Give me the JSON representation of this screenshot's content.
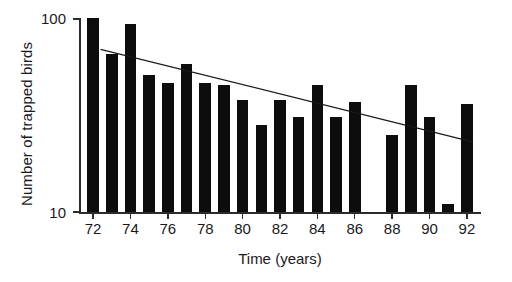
{
  "chart_data": {
    "type": "bar",
    "title": "",
    "subtitle": "",
    "xlabel": "Time (years)",
    "ylabel": "Number of trapped birds",
    "yscale": "log",
    "ylim": [
      10,
      100
    ],
    "ytick_labels": [
      "100",
      "10"
    ],
    "ytick_values": [
      100,
      10
    ],
    "xlim": [
      71.3,
      92.7
    ],
    "xtick_labels": [
      "72",
      "74",
      "76",
      "78",
      "80",
      "82",
      "84",
      "86",
      "88",
      "90",
      "92"
    ],
    "xtick_values": [
      72,
      74,
      76,
      78,
      80,
      82,
      84,
      86,
      88,
      90,
      92
    ],
    "grid": false,
    "legend": false,
    "categories": [
      72,
      73,
      74,
      75,
      76,
      77,
      78,
      79,
      80,
      81,
      82,
      83,
      84,
      85,
      86,
      87,
      88,
      89,
      90,
      91,
      92
    ],
    "values": [
      100,
      65,
      93,
      51,
      46,
      58,
      46,
      45,
      38,
      28,
      38,
      31,
      45,
      31,
      37,
      null,
      25,
      45,
      31,
      11,
      36
    ],
    "series": [
      {
        "name": "Number of trapped birds",
        "type": "bar",
        "color": "#0d0d0d",
        "values": [
          100,
          65,
          93,
          51,
          46,
          58,
          46,
          45,
          38,
          28,
          38,
          31,
          45,
          31,
          37,
          null,
          25,
          45,
          31,
          11,
          36
        ]
      },
      {
        "name": "trend",
        "type": "line",
        "color": "#1a1a1a",
        "x": [
          72.4,
          92.3
        ],
        "y": [
          69,
          23
        ]
      }
    ]
  },
  "axis": {
    "y_top_label": "100",
    "y_bottom_label": "10",
    "y_title": "Number of trapped birds",
    "x_title": "Time (years)"
  },
  "colors": {
    "bar": "#0d0d0d",
    "axis": "#2b2b2b",
    "text": "#1a1a1a",
    "background": "#ffffff",
    "trend": "#1a1a1a"
  }
}
